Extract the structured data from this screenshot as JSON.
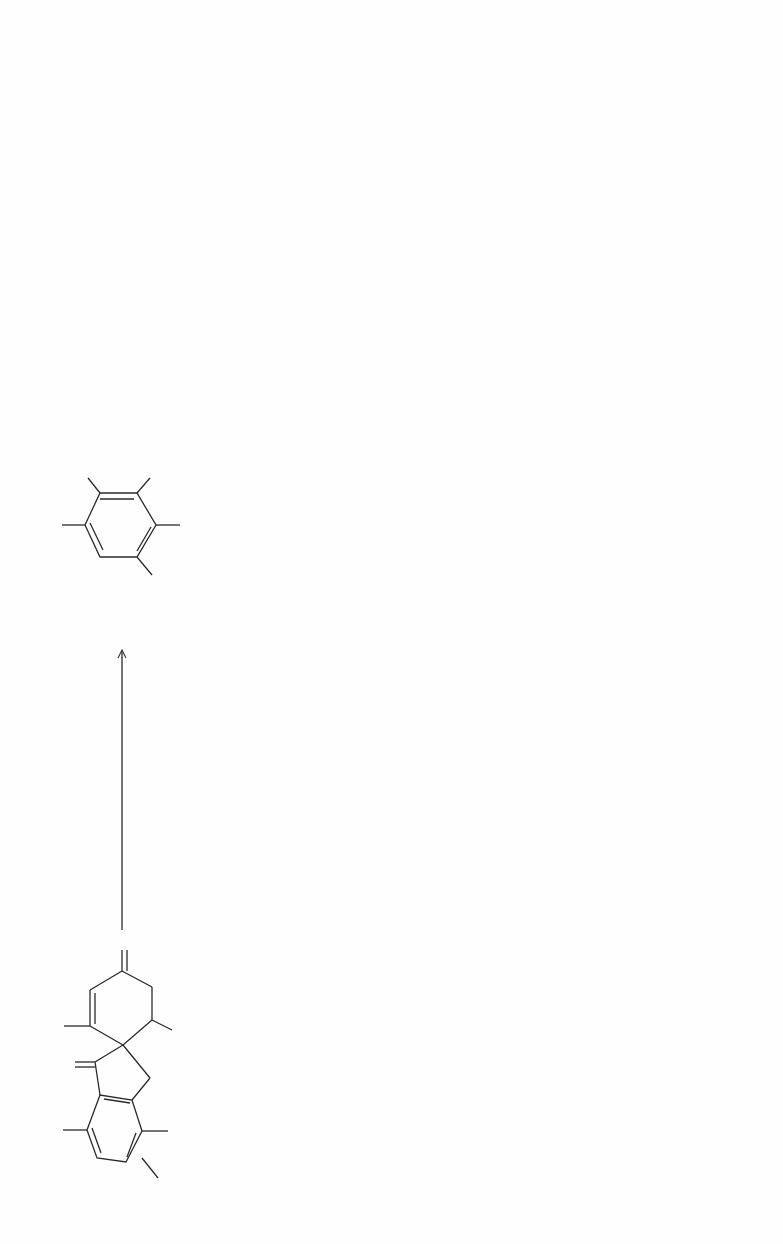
{
  "legend": {
    "compound_name": "Griseofulvin",
    "compound_value": "(7.0)",
    "note": "(7.0) = relative radioactivity"
  },
  "reagents": {
    "hydroxide": "OH",
    "hydroxide_charge": "⊖",
    "heat": "Δ",
    "reduction": "[H]",
    "acid": "H⁺",
    "kuhn_roth": "Kuhn-Roth",
    "nitric_acid": "HNO₃",
    "li_salt": "Li salt",
    "naoi": "NaOI",
    "oxidation": "[O]",
    "barium_hypobromite": "Ba(OBr)₂"
  },
  "compounds": {
    "griseofulvin": {
      "labels": [
        "OCH₃",
        "O",
        "OCH₃",
        "O",
        "O",
        "CH₃O",
        "Cl"
      ]
    },
    "chloro_acid": {
      "labels": [
        "OCH₃",
        "COOH",
        "OH",
        "Cl",
        "CH₃O"
      ],
      "value": "(4.06)"
    },
    "chloro_phenol": {
      "labels": [
        "OCH₃",
        "OH",
        "Cl",
        "CH₃O"
      ]
    },
    "co2": {
      "label": "CO₂"
    },
    "baco3_from_co2": {
      "label": "BaCO₃",
      "value": "(1.03)"
    },
    "phloroglucinol": {
      "labels": [
        "OH",
        "OH",
        "HO"
      ]
    },
    "trinitrophloroglucinol": {
      "labels": [
        "NO₂",
        "OH",
        "OH",
        "NO₂",
        "O₂N",
        "HO"
      ]
    },
    "phloro_products": {
      "baco3": "3BaCO₃",
      "baco3_value": "(1.03)",
      "plus": "+",
      "cbr3no2": "3CBr₃NO₂",
      "cbr3no2_value": "(0)"
    },
    "orcinol": {
      "labels": [
        "CH₃",
        "OH",
        "HO"
      ],
      "value": "(2.93)"
    },
    "acetic_acid": {
      "label": "CH₃COOH"
    },
    "acetone_products": {
      "acetone": "(CH₃)₂CO",
      "plus": "+",
      "li2co3": "Li₂CO₃",
      "li2co3_value": "(1.05)"
    },
    "iodoform": {
      "label": "CHI₃"
    },
    "baco3_from_iodoform": {
      "label": "BaCO₃",
      "value": "(0)"
    },
    "trinitroorcinol": {
      "labels": [
        "CH₃",
        "NO₂",
        "OH",
        "NO₂",
        "O₂N",
        "HO"
      ],
      "value": "(3.02)"
    },
    "orcinol_products": {
      "baco3": "3BaCO₃",
      "baco3_value": "(0.97)",
      "plus": "+",
      "cbr3no2": "3CBr₃NO₂",
      "cbr3no2_value": "(0)"
    }
  },
  "plus_signs": [
    "+",
    "+"
  ]
}
